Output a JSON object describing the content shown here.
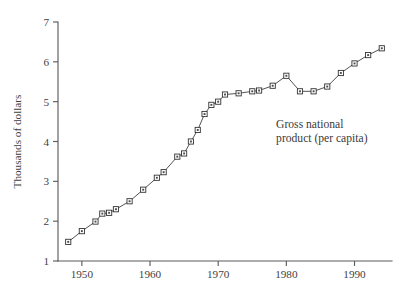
{
  "chart_data": {
    "type": "line",
    "title": "",
    "subtitle": "",
    "xlabel": "",
    "ylabel": "Thousands of dollars",
    "xlim": [
      1946.5,
      1995.5
    ],
    "ylim": [
      1,
      7
    ],
    "grid": false,
    "legend": "none",
    "annotations": [
      {
        "name": "series-annotation",
        "lines": [
          "Gross national",
          "product (per capita)"
        ],
        "x": 1978.5,
        "y": 4.35
      }
    ],
    "x_ticks": [
      1950,
      1960,
      1970,
      1980,
      1990
    ],
    "x_tick_labels": [
      "1950",
      "1960",
      "1970",
      "1980",
      "1990"
    ],
    "y_ticks": [
      1,
      2,
      3,
      4,
      5,
      6,
      7
    ],
    "y_tick_labels": [
      "1",
      "2",
      "3",
      "4",
      "5",
      "6",
      "7"
    ],
    "series": [
      {
        "name": "Gross national product (per capita)",
        "marker": "square",
        "color": "#4a4a4a",
        "x": [
          1948,
          1950,
          1952,
          1953,
          1954,
          1955,
          1957,
          1959,
          1961,
          1962,
          1964,
          1965,
          1966,
          1967,
          1968,
          1969,
          1970,
          1971,
          1973,
          1975,
          1976,
          1978,
          1980,
          1982,
          1984,
          1986,
          1988,
          1990,
          1992,
          1994
        ],
        "values": [
          1.48,
          1.75,
          1.99,
          2.19,
          2.21,
          2.3,
          2.5,
          2.79,
          3.09,
          3.23,
          3.62,
          3.7,
          4.0,
          4.29,
          4.69,
          4.92,
          5.0,
          5.18,
          5.21,
          5.26,
          5.28,
          5.4,
          5.65,
          5.26,
          5.26,
          5.38,
          5.72,
          5.96,
          6.17,
          6.34
        ]
      }
    ]
  },
  "geometry": {
    "plot_left": 58,
    "plot_right": 392,
    "plot_top": 22,
    "plot_bottom": 261,
    "y_axis_top": 22,
    "y_axis_bottom": 261
  }
}
